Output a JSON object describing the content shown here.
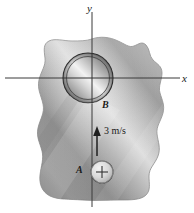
{
  "figure": {
    "background_color": "#ffffff",
    "ink_color": "#1a1a1a",
    "width": 194,
    "height": 213
  },
  "axes": {
    "x_label": "x",
    "y_label": "y",
    "origin": {
      "x": 92,
      "y": 78
    },
    "x_axis": {
      "x1": 5,
      "y1": 78,
      "x2": 180,
      "y2": 78
    },
    "y_axis": {
      "x1": 92,
      "y1": 12,
      "x2": 92,
      "y2": 207
    },
    "line_color": "#3a3a3a"
  },
  "body": {
    "name": "shaded-irregular-blob",
    "fill_light": "#e6e6e6",
    "fill_mid": "#b3b3b3",
    "fill_dark": "#8a8a8a",
    "outline_color": "#9a9a9a"
  },
  "points": [
    {
      "id": "B",
      "label": "B",
      "kind": "hole",
      "center": {
        "x": 88,
        "y": 78
      },
      "radius": 25,
      "label_position": {
        "x": 104,
        "y": 108
      }
    },
    {
      "id": "A",
      "label": "A",
      "kind": "pin",
      "marker": "plus-crosshair",
      "center": {
        "x": 102,
        "y": 172
      },
      "radius": 11,
      "label_position": {
        "x": 80,
        "y": 172
      }
    }
  ],
  "velocity": {
    "name": "velocity-vector",
    "label": "3 m/s",
    "magnitude": 3,
    "unit": "m/s",
    "direction": "up",
    "arrow": {
      "x": 97,
      "y_tail": 156,
      "y_head": 127
    }
  }
}
